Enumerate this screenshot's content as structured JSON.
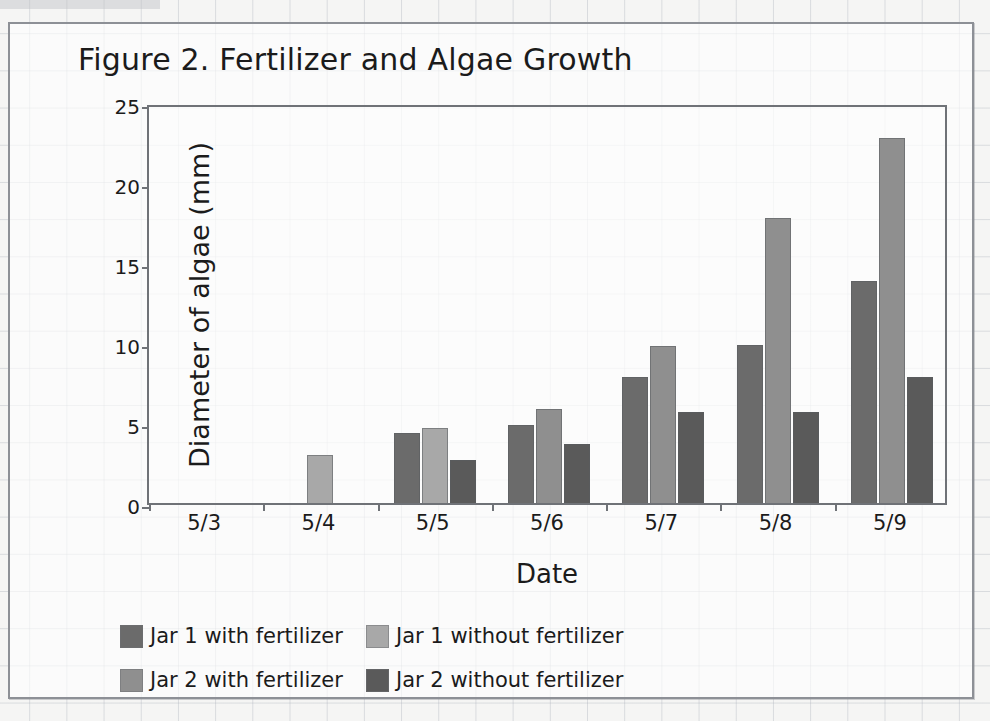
{
  "chart_data": {
    "type": "bar",
    "title": "Figure 2. Fertilizer and Algae Growth",
    "xlabel": "Date",
    "ylabel": "Diameter of algae (mm)",
    "categories": [
      "5/3",
      "5/4",
      "5/5",
      "5/6",
      "5/7",
      "5/8",
      "5/9"
    ],
    "yticks": [
      0,
      5,
      10,
      15,
      20,
      25
    ],
    "ylim": [
      0,
      25
    ],
    "grid": true,
    "legend_position": "bottom",
    "series": [
      {
        "name": "Jar 1 with fertilizer",
        "color": "#6b6b6b",
        "values": [
          0,
          0,
          4.4,
          4.9,
          7.9,
          9.9,
          13.9
        ]
      },
      {
        "name": "Jar 1 without fertilizer",
        "color": "#a8a8a8",
        "values": [
          0,
          3.0,
          4.7,
          0,
          0,
          0,
          0
        ]
      },
      {
        "name": "Jar 2 with fertilizer",
        "color": "#8f8f8f",
        "values": [
          0,
          0,
          0,
          5.9,
          9.8,
          17.8,
          22.8
        ]
      },
      {
        "name": "Jar 2 without fertilizer",
        "color": "#5a5a5a",
        "values": [
          0,
          0,
          2.7,
          3.7,
          5.7,
          5.7,
          7.9
        ]
      }
    ]
  },
  "colors": {
    "axis": "#6f7277",
    "text": "#1b1b1b",
    "card_border": "#8d9096",
    "page_background": "#f5f5f4",
    "grid_line": "#aab0ba"
  }
}
